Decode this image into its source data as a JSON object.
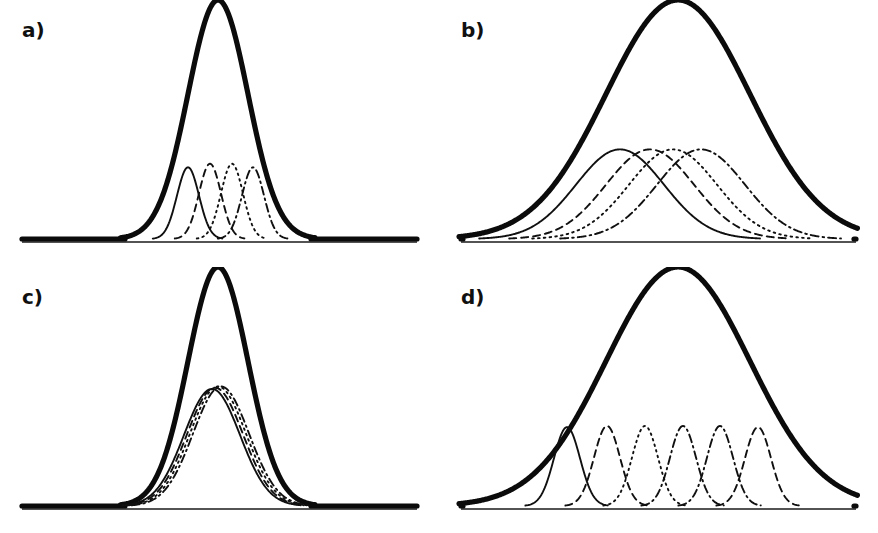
{
  "figure": {
    "width": 878,
    "height": 533,
    "background": "#ffffff",
    "ink_color": "#101010",
    "layout": "2x2 grid of four unlabeled density plots"
  },
  "panels": [
    {
      "id": "a",
      "label": "a)"
    },
    {
      "id": "b",
      "label": "b)"
    },
    {
      "id": "c",
      "label": "c)"
    },
    {
      "id": "d",
      "label": "d)"
    }
  ],
  "chart_data": [
    {
      "type": "line",
      "panel": "a",
      "title": "",
      "subtitle": "",
      "xlabel": "",
      "ylabel": "",
      "xlim": [
        0,
        439
      ],
      "ylim": [
        0,
        1
      ],
      "grid": false,
      "legend": "none",
      "axis_ticks": "none",
      "baseline_y_px": 239,
      "annotations": [
        "a)"
      ],
      "series": [
        {
          "name": "envelope",
          "role": "mixture-total",
          "style": "solid",
          "linewidth": "thick",
          "mean_px": 218,
          "sigma_px": 30,
          "amplitude": 1.0,
          "peak_px": [
            218,
            42
          ]
        },
        {
          "name": "component-1",
          "role": "mixture-component",
          "style": "solid",
          "linewidth": "thin",
          "mean_px": 188,
          "sigma_px": 11,
          "amplitude": 0.3
        },
        {
          "name": "component-2",
          "role": "mixture-component",
          "style": "dashed",
          "linewidth": "thin",
          "mean_px": 210,
          "sigma_px": 11,
          "amplitude": 0.315
        },
        {
          "name": "component-3",
          "role": "mixture-component",
          "style": "dotted",
          "linewidth": "thin",
          "mean_px": 232,
          "sigma_px": 11,
          "amplitude": 0.315
        },
        {
          "name": "component-4",
          "role": "mixture-component",
          "style": "dashdot",
          "linewidth": "thin",
          "mean_px": 253,
          "sigma_px": 11,
          "amplitude": 0.3
        }
      ]
    },
    {
      "type": "line",
      "panel": "b",
      "title": "",
      "subtitle": "",
      "xlabel": "",
      "ylabel": "",
      "xlim": [
        0,
        439
      ],
      "ylim": [
        0,
        1
      ],
      "grid": false,
      "legend": "none",
      "axis_ticks": "none",
      "baseline_y_px": 239,
      "annotations": [
        "b)"
      ],
      "series": [
        {
          "name": "envelope",
          "role": "mixture-total",
          "style": "solid",
          "linewidth": "thick",
          "mean_px": 239,
          "sigma_px": 72,
          "amplitude": 1.0,
          "peak_px": [
            239,
            42
          ]
        },
        {
          "name": "component-1",
          "role": "mixture-component",
          "style": "solid",
          "linewidth": "thin",
          "mean_px": 181,
          "sigma_px": 44,
          "amplitude": 0.375
        },
        {
          "name": "component-2",
          "role": "mixture-component",
          "style": "dashed",
          "linewidth": "thin",
          "mean_px": 211,
          "sigma_px": 44,
          "amplitude": 0.375
        },
        {
          "name": "component-3",
          "role": "mixture-component",
          "style": "dotted",
          "linewidth": "thin",
          "mean_px": 234,
          "sigma_px": 44,
          "amplitude": 0.375
        },
        {
          "name": "component-4",
          "role": "mixture-component",
          "style": "dashdot",
          "linewidth": "thin",
          "mean_px": 262,
          "sigma_px": 44,
          "amplitude": 0.375
        }
      ]
    },
    {
      "type": "line",
      "panel": "c",
      "title": "",
      "subtitle": "",
      "xlabel": "",
      "ylabel": "",
      "xlim": [
        0,
        439
      ],
      "ylim": [
        0,
        1
      ],
      "grid": false,
      "legend": "none",
      "axis_ticks": "none",
      "baseline_y_px": 239,
      "annotations": [
        "c)"
      ],
      "series": [
        {
          "name": "envelope",
          "role": "mixture-total",
          "style": "solid",
          "linewidth": "thick",
          "mean_px": 218,
          "sigma_px": 30,
          "amplitude": 1.0,
          "peak_px": [
            218,
            38
          ]
        },
        {
          "name": "component-1",
          "role": "mixture-component",
          "style": "solid",
          "linewidth": "thin",
          "mean_px": 212,
          "sigma_px": 28,
          "amplitude": 0.49
        },
        {
          "name": "component-2",
          "role": "mixture-component",
          "style": "dashed",
          "linewidth": "thin",
          "mean_px": 215,
          "sigma_px": 28,
          "amplitude": 0.495
        },
        {
          "name": "component-3",
          "role": "mixture-component",
          "style": "dotted",
          "linewidth": "thin",
          "mean_px": 218,
          "sigma_px": 28,
          "amplitude": 0.5
        },
        {
          "name": "component-4",
          "role": "mixture-component",
          "style": "dashdot",
          "linewidth": "thin",
          "mean_px": 221,
          "sigma_px": 28,
          "amplitude": 0.5
        }
      ]
    },
    {
      "type": "line",
      "panel": "d",
      "title": "",
      "subtitle": "",
      "xlabel": "",
      "ylabel": "",
      "xlim": [
        0,
        439
      ],
      "ylim": [
        0,
        1
      ],
      "grid": false,
      "legend": "none",
      "axis_ticks": "none",
      "baseline_y_px": 239,
      "annotations": [
        "d)"
      ],
      "series": [
        {
          "name": "envelope",
          "role": "mixture-total",
          "style": "solid",
          "linewidth": "thick",
          "mean_px": 239,
          "sigma_px": 72,
          "amplitude": 1.0,
          "peak_px": [
            239,
            38
          ]
        },
        {
          "name": "component-1",
          "role": "mixture-component",
          "style": "solid",
          "linewidth": "thin",
          "mean_px": 128,
          "sigma_px": 13,
          "amplitude": 0.33
        },
        {
          "name": "component-2",
          "role": "mixture-component",
          "style": "dashed",
          "linewidth": "thin",
          "mean_px": 168,
          "sigma_px": 13,
          "amplitude": 0.335
        },
        {
          "name": "component-3",
          "role": "mixture-component",
          "style": "dotted",
          "linewidth": "thin",
          "mean_px": 206,
          "sigma_px": 13,
          "amplitude": 0.335
        },
        {
          "name": "component-4",
          "role": "mixture-component",
          "style": "dashdot",
          "linewidth": "thin",
          "mean_px": 244,
          "sigma_px": 13,
          "amplitude": 0.335
        },
        {
          "name": "component-5",
          "role": "mixture-component",
          "style": "dashdot",
          "linewidth": "thin",
          "mean_px": 281,
          "sigma_px": 13,
          "amplitude": 0.335
        },
        {
          "name": "component-6",
          "role": "mixture-component",
          "style": "dashed",
          "linewidth": "thin",
          "mean_px": 319,
          "sigma_px": 13,
          "amplitude": 0.33
        }
      ]
    }
  ]
}
